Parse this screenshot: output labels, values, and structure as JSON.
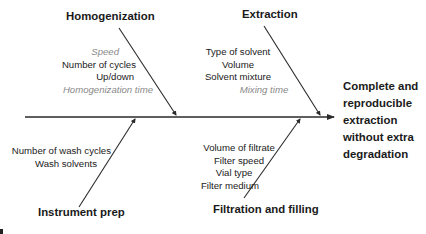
{
  "diagram": {
    "type": "fishbone",
    "outcome": {
      "lines": [
        "Complete and",
        "reproducible",
        "extraction",
        "without extra",
        "degradation"
      ]
    },
    "categories": [
      {
        "id": "homogenization",
        "title": "Homogenization",
        "position": "top-left",
        "factors": [
          {
            "text": "Speed",
            "style": "italic-gray"
          },
          {
            "text": "Number of cycles",
            "style": "normal"
          },
          {
            "text": "Up/down",
            "style": "normal"
          },
          {
            "text": "Homogenization time",
            "style": "italic-gray"
          }
        ]
      },
      {
        "id": "extraction",
        "title": "Extraction",
        "position": "top-right",
        "factors": [
          {
            "text": "Type of solvent",
            "style": "normal"
          },
          {
            "text": "Volume",
            "style": "normal"
          },
          {
            "text": "Solvent mixture",
            "style": "normal"
          },
          {
            "text": "Mixing time",
            "style": "italic-gray"
          }
        ]
      },
      {
        "id": "instrument-prep",
        "title": "Instrument prep",
        "position": "bottom-left",
        "factors": [
          {
            "text": "Number of wash cycles",
            "style": "normal"
          },
          {
            "text": "Wash solvents",
            "style": "normal"
          }
        ]
      },
      {
        "id": "filtration-filling",
        "title": "Filtration and filling",
        "position": "bottom-right",
        "factors": [
          {
            "text": "Volume of filtrate",
            "style": "normal"
          },
          {
            "text": "Filter speed",
            "style": "normal"
          },
          {
            "text": "Vial type",
            "style": "normal"
          },
          {
            "text": "Filter medium",
            "style": "normal"
          }
        ]
      }
    ],
    "colors": {
      "line": "#2a2a2a",
      "text": "#1a1a1a",
      "muted_text": "#8a8a8a"
    }
  }
}
